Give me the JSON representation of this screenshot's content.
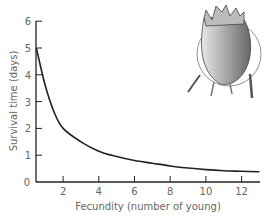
{
  "chart_data": {
    "type": "line",
    "title": "",
    "xlabel": "Fecundity (number of young)",
    "ylabel": "Survival time (days)",
    "xlim": [
      0.5,
      13
    ],
    "ylim": [
      0,
      6
    ],
    "xticks": [
      2,
      4,
      6,
      8,
      10,
      12
    ],
    "yticks": [
      0,
      1,
      2,
      3,
      4,
      5,
      6
    ],
    "grid": false,
    "legend": null,
    "series": [
      {
        "name": "survival curve",
        "x": [
          0.5,
          1,
          1.5,
          2,
          3,
          4,
          5,
          6,
          7,
          8,
          9,
          10,
          11,
          12,
          13
        ],
        "y": [
          5.0,
          3.6,
          2.6,
          2.0,
          1.5,
          1.15,
          0.95,
          0.8,
          0.7,
          0.6,
          0.52,
          0.46,
          0.42,
          0.4,
          0.38
        ]
      }
    ],
    "annotations": [
      "illustration of a mite (Acari) at upper right"
    ]
  },
  "colors": {
    "axis": "#222222",
    "curve": "#222222",
    "label": "#666666"
  }
}
